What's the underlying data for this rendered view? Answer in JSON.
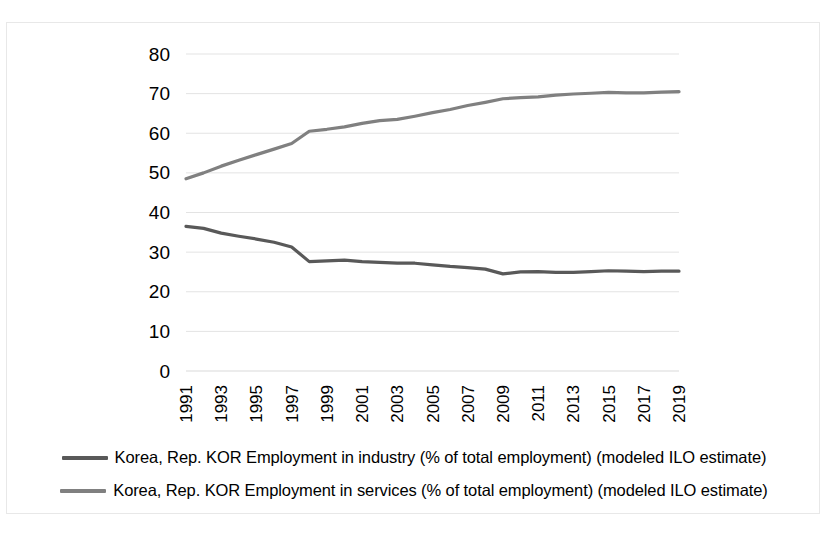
{
  "chart_data": {
    "type": "line",
    "title": "",
    "xlabel": "",
    "ylabel": "",
    "ylim": [
      0,
      80
    ],
    "ytick_step": 10,
    "yticks": [
      "0",
      "10",
      "20",
      "30",
      "40",
      "50",
      "60",
      "70",
      "80"
    ],
    "grid": true,
    "legend_position": "bottom",
    "x": [
      1991,
      1992,
      1993,
      1994,
      1995,
      1996,
      1997,
      1998,
      1999,
      2000,
      2001,
      2002,
      2003,
      2004,
      2005,
      2006,
      2007,
      2008,
      2009,
      2010,
      2011,
      2012,
      2013,
      2014,
      2015,
      2016,
      2017,
      2018,
      2019
    ],
    "xtick_labels": [
      "1991",
      "1993",
      "1995",
      "1997",
      "1999",
      "2001",
      "2003",
      "2005",
      "2007",
      "2009",
      "2011",
      "2013",
      "2015",
      "2017",
      "2019"
    ],
    "series": [
      {
        "name": "Korea, Rep. KOR Employment in industry (% of total employment) (modeled ILO estimate)",
        "color": "#595959",
        "values": [
          36.5,
          36.0,
          34.8,
          34.0,
          33.3,
          32.5,
          31.3,
          27.6,
          27.8,
          28.0,
          27.6,
          27.4,
          27.2,
          27.2,
          26.8,
          26.4,
          26.1,
          25.7,
          24.5,
          25.0,
          25.1,
          24.9,
          24.9,
          25.1,
          25.3,
          25.2,
          25.1,
          25.2,
          25.2
        ]
      },
      {
        "name": "Korea, Rep. KOR Employment in services (% of total employment) (modeled ILO estimate)",
        "color": "#808080",
        "values": [
          48.5,
          50.0,
          51.7,
          53.2,
          54.6,
          56.0,
          57.4,
          60.5,
          61.0,
          61.6,
          62.5,
          63.2,
          63.5,
          64.3,
          65.2,
          66.0,
          67.0,
          67.8,
          68.7,
          69.0,
          69.2,
          69.6,
          69.9,
          70.1,
          70.3,
          70.2,
          70.2,
          70.4,
          70.5
        ]
      }
    ]
  },
  "legend": {
    "items": [
      {
        "label": "Korea, Rep. KOR Employment in industry (% of total employment) (modeled ILO estimate)",
        "color": "#595959"
      },
      {
        "label": "Korea, Rep. KOR Employment in services (% of total employment) (modeled ILO estimate)",
        "color": "#808080"
      }
    ]
  }
}
